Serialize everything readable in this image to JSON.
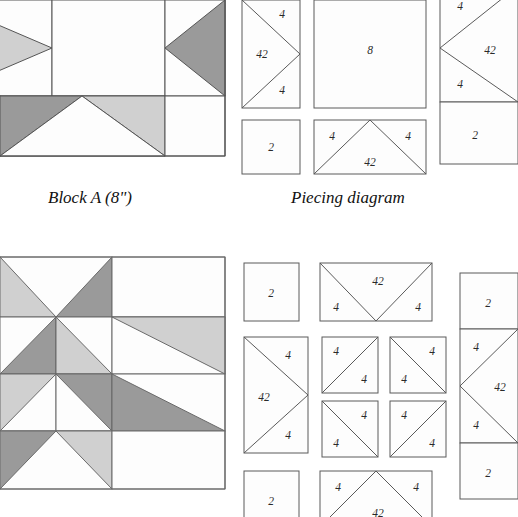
{
  "page": {
    "background": "#ffffff"
  },
  "palette": {
    "white": "#fdfdfd",
    "light_gray": "#d0d0d0",
    "dark_gray": "#9a9a9a",
    "outline": "#555555",
    "diagram_line": "#5a5a5a",
    "text": "#2a2a2a"
  },
  "captions": {
    "block_a": "Block A (8\")",
    "piecing_diagram": "Piecing diagram"
  },
  "block_a": {
    "name": "Block A",
    "size_label": "8\"",
    "grid": "5x5 star block (cropped left and top)",
    "cells": [
      {
        "row": 0,
        "col": 0,
        "shape": "triangle-dark"
      },
      {
        "row": 0,
        "col": 1,
        "shape": "square-white"
      },
      {
        "row": 0,
        "col": 2,
        "shape": "triangle-light"
      },
      {
        "row": 1,
        "col": 0,
        "shape": "flying-geese-light"
      },
      {
        "row": 1,
        "col": 1,
        "shape": "square-white-large"
      },
      {
        "row": 1,
        "col": 2,
        "shape": "flying-geese-dark"
      },
      {
        "row": 2,
        "col": 0,
        "shape": "square-white"
      },
      {
        "row": 2,
        "col": 1,
        "shape": "flying-geese-dark-light"
      },
      {
        "row": 2,
        "col": 2,
        "shape": "square-white"
      }
    ]
  },
  "block_a_piecing": {
    "columns": [
      {
        "id": "left-column",
        "units": [
          {
            "id": "fg-right",
            "type": "flying-geese",
            "point": "right",
            "labels": {
              "center": "42",
              "top": "4",
              "bottom": "4"
            }
          },
          {
            "id": "square-2",
            "type": "square",
            "labels": {
              "center": "2"
            }
          }
        ]
      },
      {
        "id": "center-column",
        "units": [
          {
            "id": "square-8",
            "type": "square",
            "labels": {
              "center": "8"
            }
          },
          {
            "id": "fg-up",
            "type": "flying-geese",
            "point": "up",
            "labels": {
              "center": "42",
              "left": "4",
              "right": "4"
            }
          }
        ]
      },
      {
        "id": "right-column",
        "units": [
          {
            "id": "fg-left",
            "type": "flying-geese",
            "point": "left",
            "labels": {
              "center": "42",
              "top": "4",
              "bottom": "4"
            }
          },
          {
            "id": "square-2",
            "type": "square",
            "labels": {
              "center": "2"
            }
          }
        ]
      }
    ]
  },
  "block_b": {
    "name": "Block B",
    "grid": "5x5 eight-pointed star block (cropped left)",
    "description": "Pinwheel star with light and dark gray half-square triangles"
  },
  "block_b_piecing": {
    "rows": [
      {
        "id": "top-row",
        "units": [
          {
            "id": "square-2",
            "type": "square",
            "labels": {
              "center": "2"
            }
          },
          {
            "id": "fg-down",
            "type": "flying-geese",
            "point": "down",
            "labels": {
              "center": "42",
              "left": "4",
              "right": "4"
            }
          }
        ]
      },
      {
        "id": "middle-row",
        "units": [
          {
            "id": "fg-right",
            "type": "flying-geese",
            "point": "right",
            "labels": {
              "center": "42",
              "top": "4",
              "bottom": "4"
            }
          },
          {
            "id": "hst-tl",
            "type": "half-square-triangle",
            "diagonal": "bl-tr",
            "labels": {
              "upper": "4",
              "lower": "4"
            }
          },
          {
            "id": "hst-tr",
            "type": "half-square-triangle",
            "diagonal": "tl-br",
            "labels": {
              "upper": "4",
              "lower": "4"
            }
          },
          {
            "id": "hst-bl",
            "type": "half-square-triangle",
            "diagonal": "tl-br",
            "labels": {
              "upper": "4",
              "lower": "4"
            }
          },
          {
            "id": "hst-br",
            "type": "half-square-triangle",
            "diagonal": "bl-tr",
            "labels": {
              "upper": "4",
              "lower": "4"
            }
          }
        ]
      },
      {
        "id": "bottom-row",
        "units": [
          {
            "id": "square-2",
            "type": "square",
            "labels": {
              "center": "2"
            }
          },
          {
            "id": "fg-up",
            "type": "flying-geese",
            "point": "up",
            "labels": {
              "center": "42",
              "left": "4",
              "right": "4"
            }
          }
        ]
      }
    ],
    "right_strip": {
      "id": "right-strip",
      "units": [
        {
          "id": "square-2-top",
          "type": "square",
          "labels": {
            "center": "2"
          }
        },
        {
          "id": "fg-left",
          "type": "flying-geese",
          "point": "left",
          "labels": {
            "center": "42",
            "top": "4",
            "bottom": "4"
          }
        },
        {
          "id": "square-2-bottom",
          "type": "square",
          "labels": {
            "center": "2"
          }
        }
      ]
    }
  },
  "labels": {
    "n2": "2",
    "n4": "4",
    "n8": "8",
    "n42": "42"
  }
}
